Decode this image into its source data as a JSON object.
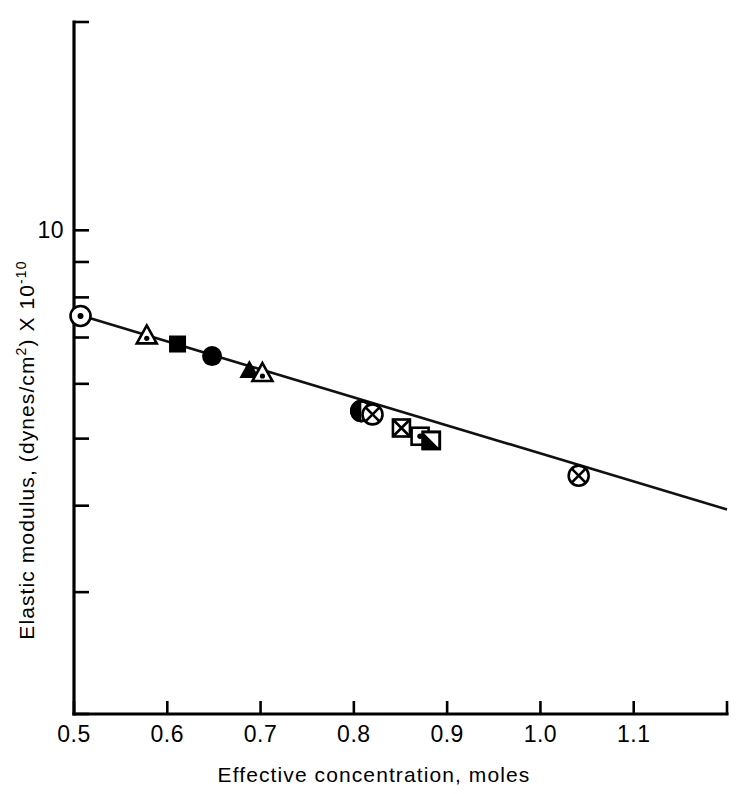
{
  "chart_data": {
    "type": "scatter",
    "title": "",
    "subtitle": "",
    "xlabel": "Effective concentration, moles",
    "ylabel_parts": {
      "main": "Elastic modulus, (dynes/cm",
      "sup1": "2",
      "mid": ") X 10",
      "sup2": "-10"
    },
    "ylabel": "Elastic modulus, (dynes/cm2) X 10-10",
    "xlim": [
      0.5,
      1.2
    ],
    "ylim": [
      2.0,
      20.0
    ],
    "yscale": "log",
    "xscale": "linear",
    "grid": false,
    "legend": "none",
    "xticks": [
      0.5,
      0.6,
      0.7,
      0.8,
      0.9,
      1.0,
      1.1,
      1.2
    ],
    "xtick_labels": [
      "0.5",
      "0.6",
      "0.7",
      "0.8",
      "0.9",
      "1.0",
      "1.1",
      ""
    ],
    "yticks": [
      2,
      3,
      4,
      5,
      6,
      7,
      8,
      9,
      10,
      20
    ],
    "ytick_labels": [
      "",
      "",
      "",
      "",
      "",
      "",
      "",
      "",
      "10",
      ""
    ],
    "fit_line": {
      "name": "best fit line",
      "x_start": 0.505,
      "y_start": 7.55,
      "x_end": 1.2,
      "y_end": 3.95
    },
    "points": [
      {
        "x": 0.507,
        "y": 7.52,
        "marker": "circle-dot"
      },
      {
        "x": 0.578,
        "y": 7.05,
        "marker": "triangle-dot"
      },
      {
        "x": 0.611,
        "y": 6.85,
        "marker": "square-filled"
      },
      {
        "x": 0.648,
        "y": 6.58,
        "marker": "circle-filled"
      },
      {
        "x": 0.688,
        "y": 6.28,
        "marker": "triangle-filled"
      },
      {
        "x": 0.702,
        "y": 6.22,
        "marker": "triangle-dot"
      },
      {
        "x": 0.808,
        "y": 5.48,
        "marker": "circle-half"
      },
      {
        "x": 0.82,
        "y": 5.42,
        "marker": "circle-x"
      },
      {
        "x": 0.851,
        "y": 5.18,
        "marker": "square-x"
      },
      {
        "x": 0.871,
        "y": 5.04,
        "marker": "square-dot"
      },
      {
        "x": 0.883,
        "y": 4.97,
        "marker": "square-half"
      },
      {
        "x": 1.041,
        "y": 4.42,
        "marker": "circle-x"
      }
    ]
  }
}
